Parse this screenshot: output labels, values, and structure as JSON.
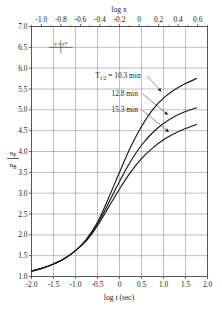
{
  "chart_data": {
    "type": "line",
    "title": "",
    "xlabel": "log t (sec)",
    "ylabel": "n_P/n_B",
    "xlabel_top": "log x",
    "xlim": [
      -2.0,
      2.0
    ],
    "ylim": [
      1.0,
      7.0
    ],
    "xlim_top": [
      -1.1,
      0.7
    ],
    "grid": true,
    "legend": "none",
    "xticks": [
      "-2.0",
      "-1.5",
      "-1.0",
      "-0.5",
      "0",
      "0.5",
      "1.0",
      "1.5",
      "2.0"
    ],
    "xtick_values": [
      -2.0,
      -1.5,
      -1.0,
      -0.5,
      0,
      0.5,
      1.0,
      1.5,
      2.0
    ],
    "yticks": [
      "1.0",
      "1.5",
      "2.0",
      "2.5",
      "3.0",
      "3.5",
      "4.0",
      "4.5",
      "5.0",
      "5.5",
      "6.0",
      "6.5",
      "7.0"
    ],
    "ytick_values": [
      1.0,
      1.5,
      2.0,
      2.5,
      3.0,
      3.5,
      4.0,
      4.5,
      5.0,
      5.5,
      6.0,
      6.5,
      7.0
    ],
    "xticks_top": [
      "-1.0",
      "-0.8",
      "-0.6",
      "-0.4",
      "-0.2",
      "0",
      "0.2",
      "0.4",
      "0.6"
    ],
    "xtick_top_values": [
      -1.0,
      -0.8,
      -0.6,
      -0.4,
      -0.2,
      0,
      0.2,
      0.4,
      0.6
    ],
    "ylabel_numerator": "n",
    "ylabel_numerator_sub": "P",
    "ylabel_denominator": "n",
    "ylabel_denominator_sub": "B",
    "marker_note": "v = v*",
    "marker_note_x": -0.8,
    "marker_note_y": 6.5,
    "series": [
      {
        "name": "T1/2 = 10.3 min",
        "label": "T",
        "label_sub": "1/2",
        "label_eq": "= 10.3 min",
        "annotation_text": "T1/2 = 10.3 min",
        "annotation_x": -0.55,
        "annotation_y": 5.82,
        "arrow_to_x": 0.95,
        "arrow_to_y": 5.44,
        "points": [
          [
            -2.0,
            1.13
          ],
          [
            -1.75,
            1.2
          ],
          [
            -1.5,
            1.3
          ],
          [
            -1.25,
            1.43
          ],
          [
            -1.0,
            1.62
          ],
          [
            -0.75,
            1.9
          ],
          [
            -0.5,
            2.3
          ],
          [
            -0.25,
            2.88
          ],
          [
            0.0,
            3.5
          ],
          [
            0.25,
            4.1
          ],
          [
            0.5,
            4.6
          ],
          [
            0.75,
            5.0
          ],
          [
            1.0,
            5.28
          ],
          [
            1.25,
            5.48
          ],
          [
            1.5,
            5.63
          ],
          [
            1.75,
            5.75
          ]
        ]
      },
      {
        "name": "12.8 min",
        "annotation_text": "12.8 min",
        "annotation_x": -0.18,
        "annotation_y": 5.4,
        "arrow_to_x": 1.1,
        "arrow_to_y": 4.88,
        "points": [
          [
            -2.0,
            1.13
          ],
          [
            -1.75,
            1.2
          ],
          [
            -1.5,
            1.3
          ],
          [
            -1.25,
            1.43
          ],
          [
            -1.0,
            1.62
          ],
          [
            -0.75,
            1.88
          ],
          [
            -0.5,
            2.26
          ],
          [
            -0.25,
            2.76
          ],
          [
            0.0,
            3.28
          ],
          [
            0.25,
            3.76
          ],
          [
            0.5,
            4.15
          ],
          [
            0.75,
            4.45
          ],
          [
            1.0,
            4.67
          ],
          [
            1.25,
            4.84
          ],
          [
            1.5,
            4.96
          ],
          [
            1.75,
            5.05
          ]
        ]
      },
      {
        "name": "15.3 min",
        "annotation_text": "15.3 min",
        "annotation_x": -0.18,
        "annotation_y": 5.0,
        "arrow_to_x": 1.12,
        "arrow_to_y": 4.47,
        "points": [
          [
            -2.0,
            1.13
          ],
          [
            -1.75,
            1.2
          ],
          [
            -1.5,
            1.3
          ],
          [
            -1.25,
            1.43
          ],
          [
            -1.0,
            1.62
          ],
          [
            -0.75,
            1.86
          ],
          [
            -0.5,
            2.22
          ],
          [
            -0.25,
            2.66
          ],
          [
            0.0,
            3.1
          ],
          [
            0.25,
            3.5
          ],
          [
            0.5,
            3.83
          ],
          [
            0.75,
            4.08
          ],
          [
            1.0,
            4.28
          ],
          [
            1.25,
            4.43
          ],
          [
            1.5,
            4.55
          ],
          [
            1.75,
            4.65
          ]
        ]
      }
    ],
    "colors": {
      "curve": "#1a1a1a",
      "grid": "#8a8a8a",
      "axis": "#555555",
      "background": "#ffffff"
    }
  }
}
